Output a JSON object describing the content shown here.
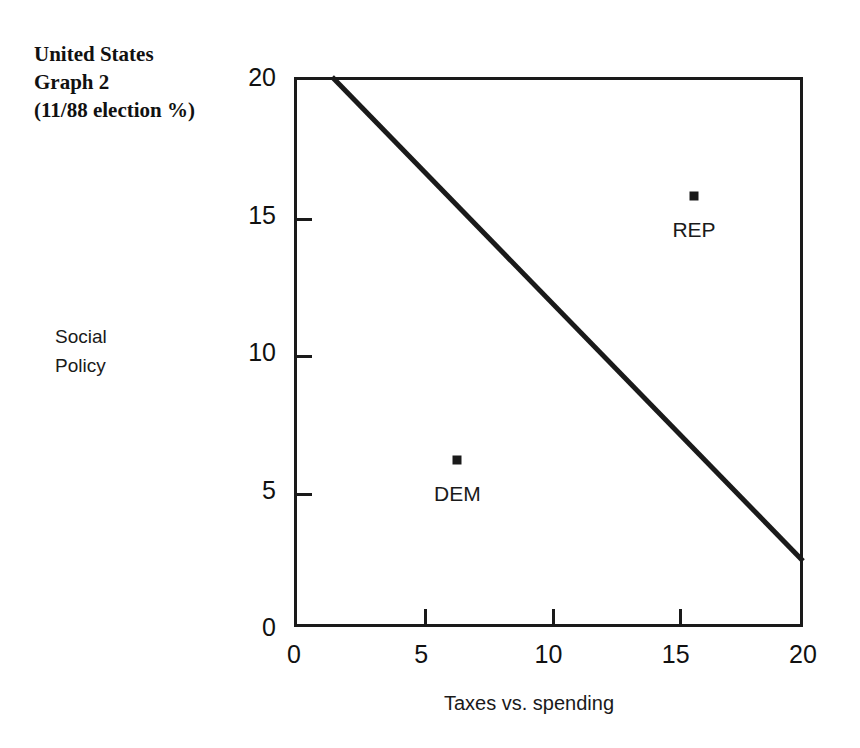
{
  "title": {
    "line1": "United States",
    "line2": "Graph 2",
    "line3": "(11/88 election %)"
  },
  "axes": {
    "ylabel_line1": "Social",
    "ylabel_line2": "Policy",
    "xlabel": "Taxes vs. spending"
  },
  "ticks": {
    "y": [
      "0",
      "5",
      "10",
      "15",
      "20"
    ],
    "x": [
      "0",
      "5",
      "10",
      "15",
      "20"
    ]
  },
  "points": {
    "dem": {
      "label": "DEM",
      "x": 6.3,
      "y": 6.2
    },
    "rep": {
      "label": "REP",
      "x": 15.6,
      "y": 15.8
    }
  },
  "colors": {
    "ink": "#1a1a1a",
    "background": "#ffffff"
  },
  "chart_data": {
    "type": "scatter",
    "title": "United States Graph 2 (11/88 election %)",
    "xlabel": "Taxes vs. spending",
    "ylabel": "Social Policy",
    "xlim": [
      0,
      20
    ],
    "ylim": [
      0,
      20
    ],
    "xticks": [
      0,
      5,
      10,
      15,
      20
    ],
    "yticks": [
      0,
      5,
      10,
      15,
      20
    ],
    "grid": false,
    "legend": "none",
    "points": [
      {
        "name": "DEM",
        "x": 6.3,
        "y": 6.2,
        "marker": "square",
        "label_position": "below"
      },
      {
        "name": "REP",
        "x": 15.6,
        "y": 15.8,
        "marker": "square",
        "label_position": "below"
      }
    ],
    "series": [
      {
        "name": "constraint line",
        "type": "line",
        "x": [
          1.5,
          20.0
        ],
        "y": [
          20.0,
          2.4
        ]
      }
    ],
    "annotations": [
      {
        "text": "DEM",
        "x": 6.3,
        "y": 4.4
      },
      {
        "text": "REP",
        "x": 15.6,
        "y": 14.0
      }
    ]
  }
}
